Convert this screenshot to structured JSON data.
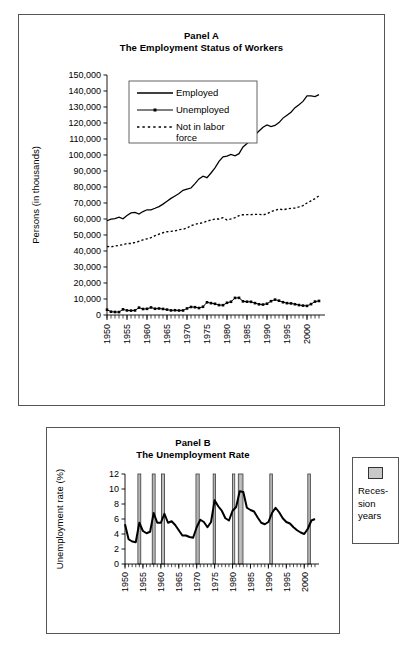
{
  "panel_a": {
    "title_line1": "Panel A",
    "title_line2": "The Employment Status of Workers",
    "ylabel": "Persons (in thousands)",
    "legend": [
      {
        "label": "Employed",
        "style": "solid"
      },
      {
        "label": "Unemployed",
        "style": "solid-marker"
      },
      {
        "label": "Not in labor",
        "label2": "force",
        "style": "dotted"
      }
    ]
  },
  "panel_b": {
    "title_line1": "Panel B",
    "title_line2": "The Unemployment Rate",
    "ylabel": "Unemployment rate (%)"
  },
  "recession_legend": {
    "line1": "Reces-",
    "line2": "sion",
    "line3": "years",
    "swatch_color": "#c9c9c9"
  },
  "chart_data": [
    {
      "id": "panel-a",
      "type": "line",
      "title": "Panel A\nThe Employment Status of Workers",
      "xlabel": "",
      "ylabel": "Persons (in thousands)",
      "xlim": [
        1950,
        2003
      ],
      "ylim": [
        0,
        150000
      ],
      "ytick_labels": [
        "0",
        "10,000",
        "20,000",
        "30,000",
        "40,000",
        "50,000",
        "60,000",
        "70,000",
        "80,000",
        "90,000",
        "100,000",
        "110,000",
        "120,000",
        "130,000",
        "140,000",
        "150,000"
      ],
      "yticks": [
        0,
        10000,
        20000,
        30000,
        40000,
        50000,
        60000,
        70000,
        80000,
        90000,
        100000,
        110000,
        120000,
        130000,
        140000,
        150000
      ],
      "xtick_labels": [
        "1950",
        "1955",
        "1960",
        "1965",
        "1970",
        "1975",
        "1980",
        "1985",
        "1990",
        "1995",
        "2000"
      ],
      "xticks": [
        1950,
        1955,
        1960,
        1965,
        1970,
        1975,
        1980,
        1985,
        1990,
        1995,
        2000
      ],
      "grid": false,
      "legend_position": "upper-left-inside",
      "x": [
        1950,
        1951,
        1952,
        1953,
        1954,
        1955,
        1956,
        1957,
        1958,
        1959,
        1960,
        1961,
        1962,
        1963,
        1964,
        1965,
        1966,
        1967,
        1968,
        1969,
        1970,
        1971,
        1972,
        1973,
        1974,
        1975,
        1976,
        1977,
        1978,
        1979,
        1980,
        1981,
        1982,
        1983,
        1984,
        1985,
        1986,
        1987,
        1988,
        1989,
        1990,
        1991,
        1992,
        1993,
        1994,
        1995,
        1996,
        1997,
        1998,
        1999,
        2000,
        2001,
        2002,
        2003
      ],
      "series": [
        {
          "name": "Employed",
          "style": "solid",
          "values": [
            58918,
            59961,
            60250,
            61179,
            60109,
            62170,
            63799,
            64071,
            63036,
            64630,
            65778,
            65746,
            66702,
            67762,
            69305,
            71088,
            72895,
            74372,
            75920,
            77902,
            78678,
            79367,
            82153,
            85064,
            86794,
            85846,
            88752,
            92017,
            96048,
            98824,
            99303,
            100397,
            99526,
            100834,
            105005,
            107150,
            109597,
            112440,
            114968,
            117342,
            118793,
            117718,
            118492,
            120259,
            123060,
            124900,
            126708,
            129558,
            131463,
            133488,
            136891,
            136933,
            136485,
            137736
          ]
        },
        {
          "name": "Unemployed",
          "style": "solid-marker",
          "values": [
            3288,
            2055,
            1883,
            1834,
            3532,
            2852,
            2750,
            2859,
            4602,
            3740,
            3852,
            4714,
            3911,
            4070,
            3786,
            3366,
            2875,
            2975,
            2817,
            2832,
            4093,
            5016,
            4882,
            4365,
            5156,
            7929,
            7406,
            6991,
            6202,
            6137,
            7637,
            8273,
            10678,
            10717,
            8539,
            8312,
            8237,
            7425,
            6701,
            6528,
            7047,
            8628,
            9613,
            8940,
            7996,
            7404,
            7236,
            6739,
            6210,
            5880,
            5692,
            6801,
            8378,
            8774
          ]
        },
        {
          "name": "Not in labor force",
          "style": "dotted",
          "values": [
            42787,
            42604,
            43093,
            43513,
            43965,
            44678,
            44660,
            45336,
            46088,
            46960,
            47617,
            48312,
            49539,
            50583,
            51394,
            52058,
            52288,
            52527,
            53291,
            53602,
            54315,
            55834,
            56655,
            57222,
            57667,
            58655,
            59377,
            59991,
            60025,
            60806,
            59414,
            60050,
            60806,
            62067,
            62665,
            62744,
            62752,
            62888,
            62944,
            62523,
            63324,
            64578,
            65415,
            66213,
            65758,
            66280,
            66647,
            66837,
            67547,
            68385,
            69994,
            71359,
            72707,
            74510
          ]
        }
      ]
    },
    {
      "id": "panel-b",
      "type": "line",
      "title": "Panel B\nThe Unemployment Rate",
      "xlabel": "",
      "ylabel": "Unemployment rate (%)",
      "xlim": [
        1950,
        2003
      ],
      "ylim": [
        0,
        12
      ],
      "yticks": [
        0,
        2,
        4,
        6,
        8,
        10,
        12
      ],
      "ytick_labels": [
        "0",
        "2",
        "4",
        "6",
        "8",
        "10",
        "12"
      ],
      "xticks": [
        1950,
        1955,
        1960,
        1965,
        1970,
        1975,
        1980,
        1985,
        1990,
        1995,
        2000
      ],
      "xtick_labels": [
        "1950",
        "1955",
        "1960",
        "1965",
        "1970",
        "1975",
        "1980",
        "1985",
        "1990",
        "1995",
        "2000"
      ],
      "grid": false,
      "x": [
        1950,
        1951,
        1952,
        1953,
        1954,
        1955,
        1956,
        1957,
        1958,
        1959,
        1960,
        1961,
        1962,
        1963,
        1964,
        1965,
        1966,
        1967,
        1968,
        1969,
        1970,
        1971,
        1972,
        1973,
        1974,
        1975,
        1976,
        1977,
        1978,
        1979,
        1980,
        1981,
        1982,
        1983,
        1984,
        1985,
        1986,
        1987,
        1988,
        1989,
        1990,
        1991,
        1992,
        1993,
        1994,
        1995,
        1996,
        1997,
        1998,
        1999,
        2000,
        2001,
        2002,
        2003
      ],
      "values": [
        5.3,
        3.3,
        3.0,
        2.9,
        5.5,
        4.4,
        4.1,
        4.3,
        6.8,
        5.5,
        5.5,
        6.7,
        5.5,
        5.7,
        5.2,
        4.5,
        3.8,
        3.8,
        3.6,
        3.5,
        4.9,
        5.9,
        5.6,
        4.9,
        5.6,
        8.5,
        7.7,
        7.1,
        6.1,
        5.8,
        7.1,
        7.6,
        9.7,
        9.6,
        7.5,
        7.2,
        7.0,
        6.2,
        5.5,
        5.3,
        5.6,
        6.8,
        7.5,
        6.9,
        6.1,
        5.6,
        5.4,
        4.9,
        4.5,
        4.2,
        4.0,
        4.7,
        5.8,
        6.0
      ],
      "shaded_regions": {
        "name": "Recession years",
        "color": "#c9c9c9",
        "spans": [
          [
            1953.6,
            1954.4
          ],
          [
            1957.6,
            1958.4
          ],
          [
            1960.2,
            1961.0
          ],
          [
            1969.8,
            1970.7
          ],
          [
            1974.6,
            1975.2
          ],
          [
            1980.0,
            1980.6
          ],
          [
            1981.6,
            1982.9
          ],
          [
            1990.4,
            1991.1
          ],
          [
            2001.0,
            2001.7
          ]
        ]
      }
    }
  ]
}
